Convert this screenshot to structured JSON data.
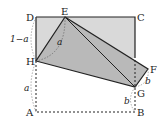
{
  "diagram": {
    "type": "folded-square-geometry",
    "points": {
      "A": {
        "label": "A",
        "x": 36,
        "y": 112
      },
      "B": {
        "label": "B",
        "x": 135,
        "y": 112
      },
      "C": {
        "label": "C",
        "x": 135,
        "y": 17
      },
      "D": {
        "label": "D",
        "x": 36,
        "y": 17
      },
      "E": {
        "label": "E",
        "x": 65,
        "y": 17
      },
      "F": {
        "label": "F",
        "x": 148,
        "y": 69
      },
      "G": {
        "label": "G",
        "x": 135,
        "y": 87
      },
      "H": {
        "label": "H",
        "x": 36,
        "y": 61
      }
    },
    "measures": {
      "DH": "1−a",
      "HA": "a",
      "EH_arc": "a",
      "FG": "b",
      "GB": "b"
    },
    "colors": {
      "folded_fill": "#b9b9b9",
      "upper_fill": "#d9d9d9",
      "line": "#222222"
    }
  }
}
